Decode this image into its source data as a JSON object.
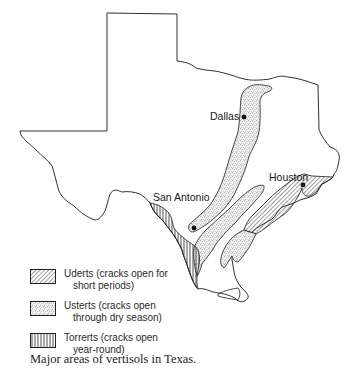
{
  "figure": {
    "caption": "Major areas of vertisols in Texas.",
    "region": "Texas"
  },
  "cities": [
    {
      "name": "Dallas",
      "label": "Dallas"
    },
    {
      "name": "Houston",
      "label": "Houston"
    },
    {
      "name": "San Antonio",
      "label": "San Antonio"
    }
  ],
  "legend": {
    "items": [
      {
        "pattern": "diagonal-hatch",
        "name": "Uderts",
        "line1": "Uderts (cracks open for",
        "line2": "short periods)"
      },
      {
        "pattern": "stipple",
        "name": "Usterts",
        "line1": "Usterts (cracks open",
        "line2": "through dry season)"
      },
      {
        "pattern": "vertical-hatch",
        "name": "Torrerts",
        "line1": "Torrerts (cracks open",
        "line2": "year-round)"
      }
    ]
  },
  "colors": {
    "outline": "#1a1a1a",
    "background": "#ffffff",
    "text": "#222222"
  }
}
